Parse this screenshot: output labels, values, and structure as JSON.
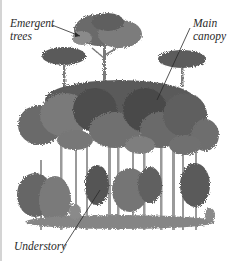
{
  "figure": {
    "style": "grayscale illustration",
    "colors": {
      "background": "#ffffff",
      "border": "#d4d4d4",
      "label_text": "#2a2a2a",
      "foliage_dark": "#4a4a4a",
      "foliage_mid": "#6e6e6e",
      "foliage_light": "#9a9a9a",
      "trunk": "#8c8c8c"
    },
    "labels": {
      "emergent": {
        "line1": "Emergent",
        "line2": "trees"
      },
      "canopy": {
        "line1": "Main",
        "line2": "canopy"
      },
      "understory": {
        "line1": "Understory"
      }
    }
  }
}
